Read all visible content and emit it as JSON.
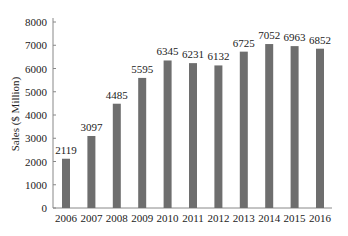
{
  "chart_data": {
    "type": "bar",
    "title": "",
    "xlabel": "",
    "ylabel": "Sales ($ Million)",
    "ylim": [
      0,
      8000
    ],
    "yticks": [
      0,
      1000,
      2000,
      3000,
      4000,
      5000,
      6000,
      7000,
      8000
    ],
    "grid": false,
    "legend": null,
    "bar_color": "#6e6e6e",
    "categories": [
      "2006",
      "2007",
      "2008",
      "2009",
      "2010",
      "2011",
      "2012",
      "2013",
      "2014",
      "2015",
      "2016"
    ],
    "values": [
      2119,
      3097,
      4485,
      5595,
      6345,
      6231,
      6132,
      6725,
      7052,
      6963,
      6852
    ],
    "data_labels": [
      "2119",
      "3097",
      "4485",
      "5595",
      "6345",
      "6231",
      "6132",
      "6725",
      "7052",
      "6963",
      "6852"
    ]
  }
}
